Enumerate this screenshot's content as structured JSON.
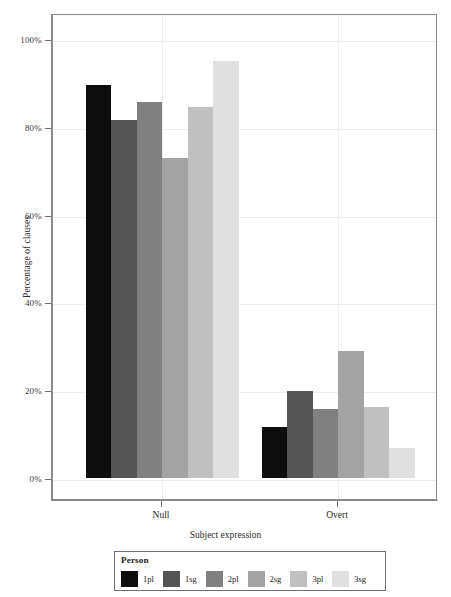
{
  "chart_data": {
    "type": "bar",
    "title": "",
    "xlabel": "Subject expression",
    "ylabel": "Percentage of clauses",
    "categories": [
      "Null",
      "Overt"
    ],
    "ylim": [
      0,
      105
    ],
    "ytick_values": [
      0,
      20,
      40,
      60,
      80,
      100
    ],
    "ytick_labels": [
      "0%",
      "20%",
      "40%",
      "60%",
      "80%",
      "100%"
    ],
    "grid": true,
    "legend_position": "bottom",
    "legend_title": "Person",
    "series": [
      {
        "name": "1pl",
        "color": "#0d0d0d",
        "values": [
          89.5,
          11.6
        ]
      },
      {
        "name": "1sg",
        "color": "#555555",
        "values": [
          81.5,
          19.8
        ]
      },
      {
        "name": "2pl",
        "color": "#808080",
        "values": [
          85.6,
          15.7
        ]
      },
      {
        "name": "2sg",
        "color": "#a3a3a3",
        "values": [
          72.9,
          28.9
        ]
      },
      {
        "name": "3pl",
        "color": "#c0c0c0",
        "values": [
          84.5,
          16.2
        ]
      },
      {
        "name": "3sg",
        "color": "#e0e0e0",
        "values": [
          95.0,
          6.8
        ]
      }
    ]
  },
  "axes": {
    "panel_border_color": "#8a8a8a",
    "gridline_color": "#ededed",
    "tick_color": "#6f6f6f"
  }
}
